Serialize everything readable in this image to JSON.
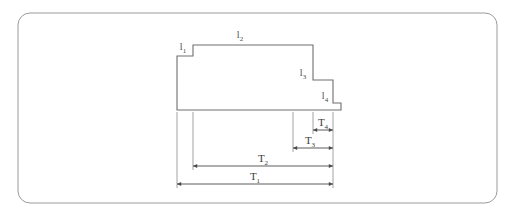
{
  "figure": {
    "background_color": "#ffffff",
    "frame": {
      "name": "rounded-border",
      "stroke_color": "#9a9a9a",
      "x": 18,
      "y": 13,
      "width": 479,
      "height": 190,
      "radius": 12
    },
    "profile": {
      "stroke_color": "#6e6e6e",
      "description": "descending step profile outline",
      "points": "177,110 177,56 193,56 193,45 313,45 313,80 333,80 333,103 341,103 341,110 177,110"
    },
    "length_labels": [
      {
        "id": "l1",
        "base": "l",
        "sub": "1",
        "x": 183,
        "y": 50
      },
      {
        "id": "l2",
        "base": "l",
        "sub": "2",
        "x": 240,
        "y": 38
      },
      {
        "id": "l3",
        "base": "l",
        "sub": "3",
        "x": 303,
        "y": 76
      },
      {
        "id": "l4",
        "base": "l",
        "sub": "4",
        "x": 325,
        "y": 99
      }
    ],
    "dimensions": [
      {
        "id": "T4",
        "base": "T",
        "sub": "4",
        "x1": 313,
        "x2": 333,
        "y": 130,
        "label_x": 323,
        "label_y": 126
      },
      {
        "id": "T3",
        "base": "T",
        "sub": "3",
        "x1": 293,
        "x2": 333,
        "y": 148,
        "label_x": 310,
        "label_y": 144
      },
      {
        "id": "T2",
        "base": "T",
        "sub": "2",
        "x1": 193,
        "x2": 333,
        "y": 166,
        "label_x": 263,
        "label_y": 162
      },
      {
        "id": "T1",
        "base": "T",
        "sub": "1",
        "x1": 177,
        "x2": 333,
        "y": 184,
        "label_x": 255,
        "label_y": 180
      }
    ],
    "extension_lines": [
      {
        "id": "ext-T1-left",
        "x": 177,
        "y1": 112,
        "y2": 188
      },
      {
        "id": "ext-T2-left",
        "x": 193,
        "y1": 112,
        "y2": 170
      },
      {
        "id": "ext-T3-left",
        "x": 293,
        "y1": 112,
        "y2": 152
      },
      {
        "id": "ext-T4-left",
        "x": 313,
        "y1": 112,
        "y2": 134
      },
      {
        "id": "ext-right",
        "x": 333,
        "y1": 112,
        "y2": 188
      }
    ]
  }
}
